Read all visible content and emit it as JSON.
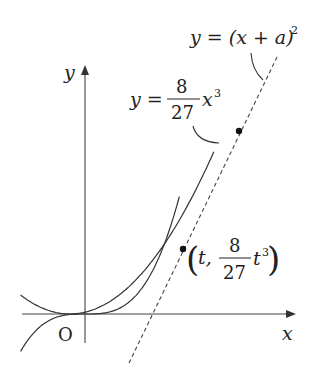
{
  "diagram": {
    "type": "function-graph",
    "axes": {
      "x_label": "x",
      "y_label": "y",
      "origin_label": "O"
    },
    "curves": [
      {
        "name": "cubic",
        "label_lhs": "y =",
        "label_num": "8",
        "label_den": "27",
        "label_var": "x",
        "label_exp": "3"
      },
      {
        "name": "parabola",
        "label": "y = (x + a)",
        "label_exp": "2"
      }
    ],
    "tangent_line": {
      "style": "dashed",
      "description": "common tangent line"
    },
    "points": [
      {
        "name": "tangent-point-cubic",
        "label_open": "(",
        "label_t": "t,",
        "label_num": "8",
        "label_den": "27",
        "label_var": "t",
        "label_exp": "3",
        "label_close": ")"
      },
      {
        "name": "tangent-point-parabola"
      }
    ]
  }
}
